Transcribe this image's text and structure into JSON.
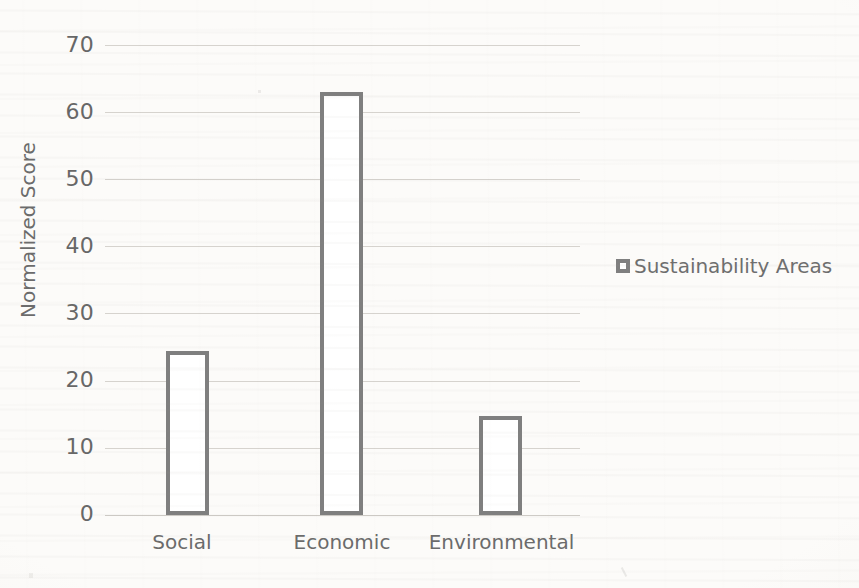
{
  "chart_data": {
    "type": "bar",
    "title": "",
    "xlabel": "",
    "ylabel": "Normalized Score",
    "categories": [
      "Social",
      "Economic",
      "Environmental"
    ],
    "values": [
      24.4,
      63.0,
      14.8
    ],
    "series": [
      {
        "name": "Sustainability Areas",
        "values": [
          24.4,
          63.0,
          14.8
        ]
      }
    ],
    "ylim": [
      0,
      70
    ],
    "yticks": [
      0,
      10,
      20,
      30,
      40,
      50,
      60,
      70
    ],
    "ytick_labels": [
      "0",
      "10",
      "20",
      "30",
      "40",
      "50",
      "60",
      "70"
    ],
    "grid": true,
    "legend": {
      "position": "right",
      "entries": [
        {
          "label": "Sustainability Areas",
          "marker": "square-outline",
          "color": "#7f7f7f",
          "fill": "#ffffff"
        }
      ]
    },
    "style": {
      "bar_edge_color": "#7f7f7f",
      "bar_fill_color": "#ffffff",
      "gridline_color": "#d6d3ce",
      "tick_label_color": "#676767",
      "axis_label_color": "#6b6b6b",
      "background_color": "#fcfbf9"
    }
  }
}
